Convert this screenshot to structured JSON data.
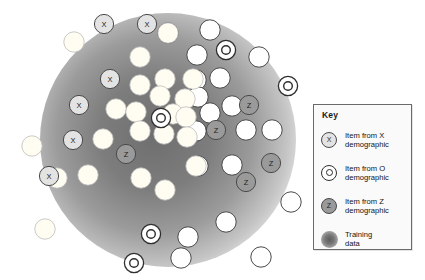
{
  "figure": {
    "title": "",
    "background": "#ffffff"
  },
  "chart_data": {
    "type": "scatter",
    "title": "",
    "xlabel": "",
    "ylabel": "",
    "grid": false,
    "legend_position": "right",
    "training_region": {
      "shape": "ellipse",
      "cx": 168,
      "cy": 140,
      "rx": 128,
      "ry": 127,
      "fill": "radial gray gradient, dark at center"
    },
    "series": [
      {
        "name": "Item from X demographic",
        "marker": "x-circle",
        "fill": "#e3e3e3",
        "points": [
          {
            "x": 104,
            "y": 24
          },
          {
            "x": 147,
            "y": 24
          },
          {
            "x": 110,
            "y": 79
          },
          {
            "x": 79,
            "y": 105
          },
          {
            "x": 73,
            "y": 140
          },
          {
            "x": 49,
            "y": 176
          }
        ]
      },
      {
        "name": "Item from O demographic",
        "marker": "o-circle",
        "fill": "#ffffff",
        "points": [
          {
            "x": 226,
            "y": 50
          },
          {
            "x": 288,
            "y": 86
          },
          {
            "x": 161,
            "y": 118
          },
          {
            "x": 151,
            "y": 234
          },
          {
            "x": 134,
            "y": 263
          }
        ]
      },
      {
        "name": "Item from Z demographic",
        "marker": "z-circle",
        "fill": "#9a9a9a",
        "points": [
          {
            "x": 249,
            "y": 105
          },
          {
            "x": 216,
            "y": 130
          },
          {
            "x": 126,
            "y": 154
          },
          {
            "x": 271,
            "y": 163
          },
          {
            "x": 246,
            "y": 182
          }
        ]
      },
      {
        "name": "Unlabelled item (inside training region)",
        "marker": "filled-circle",
        "fill": "#fffdf2",
        "points": [
          {
            "x": 74,
            "y": 42
          },
          {
            "x": 140,
            "y": 57
          },
          {
            "x": 168,
            "y": 33
          },
          {
            "x": 140,
            "y": 85
          },
          {
            "x": 165,
            "y": 79
          },
          {
            "x": 193,
            "y": 79
          },
          {
            "x": 160,
            "y": 96
          },
          {
            "x": 185,
            "y": 99
          },
          {
            "x": 116,
            "y": 109
          },
          {
            "x": 136,
            "y": 112
          },
          {
            "x": 173,
            "y": 114
          },
          {
            "x": 186,
            "y": 117
          },
          {
            "x": 140,
            "y": 131
          },
          {
            "x": 164,
            "y": 134
          },
          {
            "x": 187,
            "y": 137
          },
          {
            "x": 103,
            "y": 139
          },
          {
            "x": 32,
            "y": 146
          },
          {
            "x": 57,
            "y": 178
          },
          {
            "x": 88,
            "y": 175
          },
          {
            "x": 141,
            "y": 178
          },
          {
            "x": 165,
            "y": 190
          },
          {
            "x": 45,
            "y": 229
          },
          {
            "x": 196,
            "y": 166
          }
        ]
      },
      {
        "name": "Unlabelled item (outside training region)",
        "marker": "open-circle",
        "fill": "#ffffff",
        "points": [
          {
            "x": 168,
            "y": 33
          },
          {
            "x": 210,
            "y": 30
          },
          {
            "x": 197,
            "y": 55
          },
          {
            "x": 259,
            "y": 57
          },
          {
            "x": 196,
            "y": 80
          },
          {
            "x": 220,
            "y": 78
          },
          {
            "x": 198,
            "y": 97
          },
          {
            "x": 232,
            "y": 106
          },
          {
            "x": 210,
            "y": 113
          },
          {
            "x": 196,
            "y": 131
          },
          {
            "x": 246,
            "y": 130
          },
          {
            "x": 272,
            "y": 130
          },
          {
            "x": 198,
            "y": 166
          },
          {
            "x": 232,
            "y": 165
          },
          {
            "x": 291,
            "y": 202
          },
          {
            "x": 226,
            "y": 222
          },
          {
            "x": 181,
            "y": 258
          },
          {
            "x": 261,
            "y": 257
          },
          {
            "x": 188,
            "y": 237
          }
        ]
      }
    ]
  },
  "key": {
    "title": "Key",
    "items": [
      {
        "glyph": "X",
        "glyph_name": "x-marker-icon",
        "label": "Item from X\ndemographic"
      },
      {
        "glyph": "",
        "glyph_name": "o-marker-icon",
        "label": "Item from O\ndemographic"
      },
      {
        "glyph": "Z",
        "glyph_name": "z-marker-icon",
        "label": "Item from Z\ndemographic"
      },
      {
        "glyph": "",
        "glyph_name": "training-data-blob-icon",
        "label": "Training\ndata"
      }
    ]
  },
  "colors": {
    "x_fill": "#e3e3e3",
    "o_fill": "#ffffff",
    "z_fill": "#9a9a9a",
    "plain_fill": "#fffdf2",
    "stroke": "#3a3a3a",
    "panel_bg": "#fafafa",
    "panel_border": "#6a6a6a",
    "text": "#141414"
  }
}
